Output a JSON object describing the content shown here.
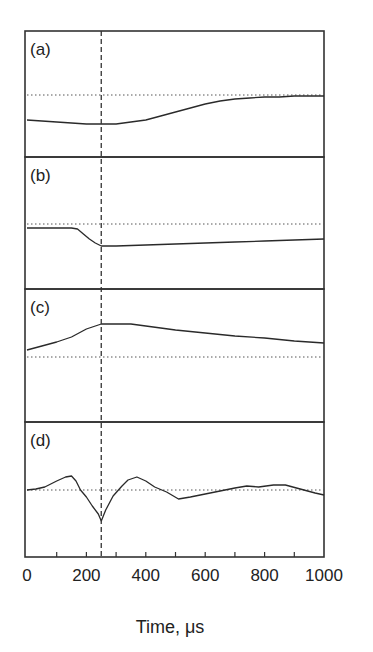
{
  "chart_data": {
    "type": "line",
    "title": "",
    "xlabel": "Time, μs",
    "ylabel": "",
    "xlim": [
      0,
      1000
    ],
    "x_ticks": [
      0,
      200,
      400,
      600,
      800,
      1000
    ],
    "x_minor_ticks": [
      100,
      300,
      500,
      700,
      900
    ],
    "grid": false,
    "legend": null,
    "shared_x": true,
    "annotations": [
      {
        "type": "vline",
        "x": 250,
        "style": "dashed",
        "spans": "all panels"
      },
      {
        "type": "hline",
        "style": "dotted",
        "description": "baseline (zero level) in each panel"
      }
    ],
    "y_units": "arbitrary (offset above dotted baseline, px)",
    "panels": [
      {
        "label": "(a)",
        "baseline": 0,
        "ylim": [
          -62,
          64
        ],
        "series": [
          {
            "name": "a",
            "x": [
              0,
              50,
              100,
              150,
              200,
              250,
              300,
              350,
              400,
              450,
              500,
              550,
              600,
              650,
              700,
              750,
              800,
              850,
              900,
              950,
              1000
            ],
            "values": [
              -25,
              -26,
              -27,
              -28,
              -29,
              -29,
              -29,
              -27,
              -25,
              -21,
              -17,
              -13,
              -9,
              -6,
              -4,
              -3,
              -2,
              -2,
              -1,
              -1,
              -1
            ]
          }
        ]
      },
      {
        "label": "(b)",
        "baseline": 0,
        "ylim": [
          -65,
          67
        ],
        "series": [
          {
            "name": "b",
            "x": [
              0,
              50,
              100,
              150,
              170,
              190,
              210,
              230,
              250,
              300,
              400,
              500,
              600,
              700,
              800,
              900,
              1000
            ],
            "values": [
              -4,
              -4,
              -4,
              -4,
              -5,
              -10,
              -15,
              -19,
              -22,
              -22,
              -21,
              -20,
              -19,
              -18,
              -17,
              -16,
              -15
            ]
          }
        ]
      },
      {
        "label": "(c)",
        "baseline": 0,
        "ylim": [
          -65,
          68
        ],
        "series": [
          {
            "name": "c",
            "x": [
              0,
              50,
              100,
              120,
              150,
              200,
              250,
              300,
              350,
              400,
              450,
              500,
              600,
              700,
              800,
              900,
              1000
            ],
            "values": [
              7,
              11,
              15,
              17,
              20,
              28,
              33,
              33,
              33,
              31,
              29,
              27,
              24,
              21,
              19,
              16,
              14
            ]
          }
        ]
      },
      {
        "label": "(d)",
        "baseline": 0,
        "ylim": [
          -67,
          68
        ],
        "series": [
          {
            "name": "d",
            "x": [
              0,
              30,
              60,
              100,
              130,
              150,
              165,
              180,
              200,
              220,
              240,
              250,
              265,
              290,
              320,
              340,
              370,
              400,
              430,
              470,
              510,
              550,
              600,
              650,
              700,
              740,
              780,
              830,
              870,
              920,
              970,
              1000
            ],
            "values": [
              0,
              1,
              3,
              9,
              13,
              14,
              9,
              0,
              -7,
              -16,
              -24,
              -31,
              -20,
              -6,
              4,
              10,
              13,
              9,
              3,
              -2,
              -9,
              -7,
              -4,
              -1,
              2,
              4,
              3,
              5,
              5,
              1,
              -3,
              -5
            ]
          }
        ]
      }
    ]
  },
  "figure": {
    "panel_labels": [
      "(a)",
      "(b)",
      "(c)",
      "(d)"
    ],
    "x_tick_labels": [
      "0",
      "200",
      "400",
      "600",
      "800",
      "1000"
    ],
    "xlabel": "Time, μs",
    "colors": {
      "line": "#2a2a2a",
      "frame": "#333333",
      "background": "#ffffff"
    }
  }
}
